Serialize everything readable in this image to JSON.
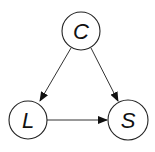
{
  "diagram": {
    "type": "directed-graph",
    "nodes": [
      {
        "id": "C",
        "label": "C",
        "cx": 81,
        "cy": 31,
        "r": 19
      },
      {
        "id": "L",
        "label": "L",
        "cx": 28,
        "cy": 120,
        "r": 19
      },
      {
        "id": "S",
        "label": "S",
        "cx": 128,
        "cy": 120,
        "r": 20
      }
    ],
    "edges": [
      {
        "from": "C",
        "to": "L"
      },
      {
        "from": "C",
        "to": "S"
      },
      {
        "from": "L",
        "to": "S"
      }
    ],
    "colors": {
      "stroke": "#222222",
      "fill": "#ffffff",
      "text": "#111111"
    }
  }
}
